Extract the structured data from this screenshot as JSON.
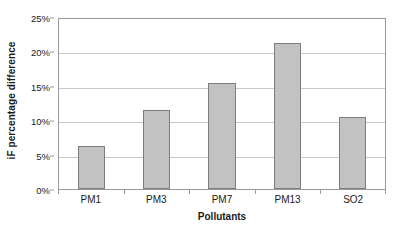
{
  "chart_data": {
    "type": "bar",
    "title": "",
    "categories": [
      "PM1",
      "PM3",
      "PM7",
      "PM13",
      "SO2"
    ],
    "values": [
      6.2,
      11.5,
      15.4,
      21.2,
      10.5
    ],
    "xlabel": "Pollutants",
    "ylabel": "iF percentage difference",
    "ylim": [
      0,
      25
    ],
    "ytick_values": [
      0,
      5,
      10,
      15,
      20,
      25
    ],
    "ytick_labels": [
      "0%",
      "5%",
      "10%",
      "15%",
      "20%",
      "25%"
    ],
    "value_suffix": "%",
    "grid": true,
    "grid_axis": "y",
    "legend": false,
    "legend_position": "none",
    "colors": {
      "bar_fill": "#c2c2c2",
      "bar_border": "#7d7d7d",
      "gridline": "#c8c8c8",
      "axis": "#9a9a9a",
      "text": "#1a1a1a",
      "background": "#ffffff"
    }
  }
}
